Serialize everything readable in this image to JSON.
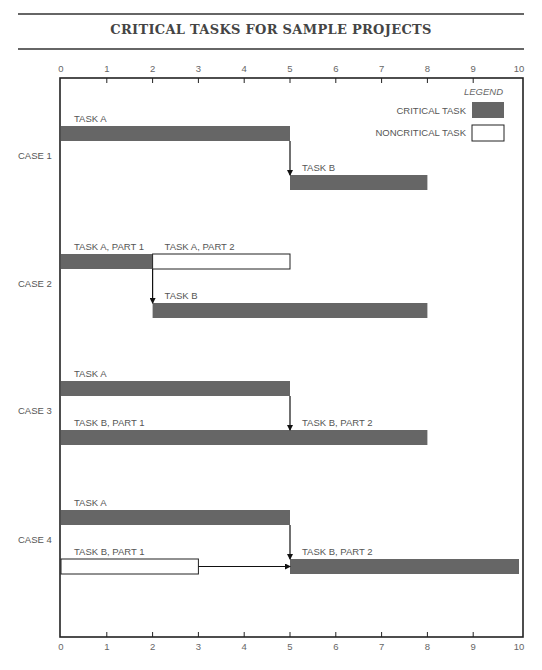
{
  "chart_data": {
    "type": "gantt",
    "title": "CRITICAL TASKS FOR SAMPLE PROJECTS",
    "xlabel": "",
    "ylabel": "",
    "xlim": [
      0,
      10
    ],
    "x_ticks": [
      "0",
      "1",
      "2",
      "3",
      "4",
      "5",
      "6",
      "7",
      "8",
      "9",
      "10"
    ],
    "grid": false,
    "legend": {
      "title": "LEGEND",
      "placement": "top-right",
      "entries": [
        {
          "label": "CRITICAL TASK",
          "kind": "critical"
        },
        {
          "label": "NONCRITICAL TASK",
          "kind": "noncritical"
        }
      ]
    },
    "colors": {
      "critical": "#666666",
      "noncritical": "#ffffff",
      "outline": "#222222"
    },
    "cases": [
      {
        "label": "CASE 1",
        "rows": [
          {
            "segments": [
              {
                "label": "TASK A",
                "start": 0,
                "end": 5,
                "kind": "critical"
              }
            ]
          },
          {
            "segments": [
              {
                "label": "TASK B",
                "start": 5,
                "end": 8,
                "kind": "critical"
              }
            ]
          }
        ],
        "arrows": [
          {
            "type": "vertical",
            "x": 5
          }
        ]
      },
      {
        "label": "CASE 2",
        "rows": [
          {
            "segments": [
              {
                "label": "TASK A, PART 1",
                "start": 0,
                "end": 2,
                "kind": "critical"
              },
              {
                "label": "TASK A, PART 2",
                "start": 2,
                "end": 5,
                "kind": "noncritical"
              }
            ]
          },
          {
            "segments": [
              {
                "label": "TASK B",
                "start": 2,
                "end": 8,
                "kind": "critical"
              }
            ]
          }
        ],
        "arrows": [
          {
            "type": "vertical",
            "x": 2
          }
        ]
      },
      {
        "label": "CASE 3",
        "rows": [
          {
            "segments": [
              {
                "label": "TASK A",
                "start": 0,
                "end": 5,
                "kind": "critical"
              }
            ]
          },
          {
            "segments": [
              {
                "label": "TASK B, PART 1",
                "start": 0,
                "end": 5,
                "kind": "critical"
              },
              {
                "label": "TASK B, PART 2",
                "start": 5,
                "end": 8,
                "kind": "critical"
              }
            ]
          }
        ],
        "arrows": [
          {
            "type": "vertical",
            "x": 5
          }
        ]
      },
      {
        "label": "CASE 4",
        "rows": [
          {
            "segments": [
              {
                "label": "TASK A",
                "start": 0,
                "end": 5,
                "kind": "critical"
              }
            ]
          },
          {
            "segments": [
              {
                "label": "TASK B, PART 1",
                "start": 0,
                "end": 3,
                "kind": "noncritical"
              },
              {
                "label": "TASK B, PART 2",
                "start": 5,
                "end": 10,
                "kind": "critical"
              }
            ]
          }
        ],
        "arrows": [
          {
            "type": "vertical",
            "x": 5
          },
          {
            "type": "horizontal",
            "from": 3,
            "to": 5
          }
        ]
      }
    ]
  }
}
